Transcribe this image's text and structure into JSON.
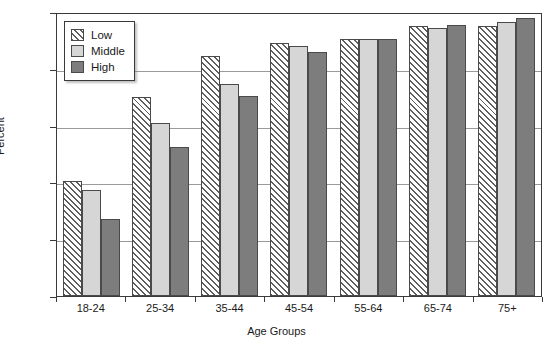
{
  "chart_data": {
    "type": "bar",
    "title": "",
    "subtitle": "",
    "xlabel": "Age Groups",
    "ylabel": "Percent",
    "categories": [
      "18-24",
      "25-34",
      "35-44",
      "45-54",
      "55-64",
      "65-74",
      "75+"
    ],
    "series": [
      {
        "name": "Low",
        "values": [
          40.5,
          70.0,
          84.5,
          89.0,
          90.5,
          95.0,
          95.0
        ]
      },
      {
        "name": "Middle",
        "values": [
          37.5,
          61.0,
          74.5,
          88.0,
          90.5,
          94.5,
          96.5
        ]
      },
      {
        "name": "High",
        "values": [
          27.0,
          52.5,
          70.5,
          86.0,
          90.5,
          95.5,
          98.0
        ]
      }
    ],
    "ylim": [
      0,
      100
    ],
    "yticks": [
      0,
      20,
      40,
      60,
      80,
      100
    ],
    "ytick_labels": [
      "0",
      "20",
      "40",
      "60",
      "80",
      "100"
    ],
    "grid": true,
    "grid_axis": "y",
    "legend_position": "top-left",
    "colors": {
      "low": "#ffffff",
      "low_hatch": "#5e5e5e",
      "middle": "#d6d6d6",
      "high": "#7d7d7d",
      "axis": "#3a3a3a",
      "grid": "#9a9a9a"
    }
  },
  "legend": {
    "items": [
      {
        "label": "Low"
      },
      {
        "label": "Middle"
      },
      {
        "label": "High"
      }
    ]
  }
}
